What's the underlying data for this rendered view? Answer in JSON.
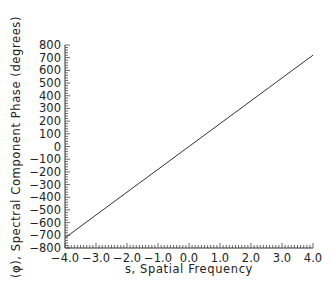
{
  "chart_data": {
    "type": "line",
    "title": "",
    "xlabel": "s, Spatial Frequency",
    "ylabel": "(φ), Spectral Component Phase (degrees)",
    "xlim": [
      -4.0,
      4.0
    ],
    "ylim": [
      -800,
      800
    ],
    "x_ticks": [
      "-4.0",
      "-3.0",
      "-2.0",
      "-1.0",
      "0.0",
      "1.0",
      "2.0",
      "3.0",
      "4.0"
    ],
    "y_ticks": [
      "800",
      "700",
      "600",
      "500",
      "400",
      "300",
      "200",
      "100",
      "0",
      "-100",
      "-200",
      "-300",
      "-400",
      "-500",
      "-600",
      "-700",
      "-800"
    ],
    "grid": false,
    "legend": null,
    "series": [
      {
        "name": "phase",
        "x": [
          -4.0,
          4.0
        ],
        "y": [
          -720,
          720
        ],
        "color": "#333333"
      }
    ]
  }
}
